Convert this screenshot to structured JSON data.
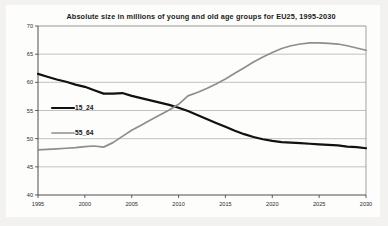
{
  "chart_data": {
    "type": "line",
    "title": "Absolute size in millions of young and old age groups for EU25, 1995-2030",
    "xlabel": "",
    "ylabel": "",
    "xlim": [
      1995,
      2030
    ],
    "ylim": [
      40,
      70
    ],
    "ytick_step": 5,
    "xtick_step": 5,
    "grid": true,
    "legend_position": "inside-left",
    "yticks": [
      "70",
      "65",
      "60",
      "55",
      "50",
      "45",
      "40"
    ],
    "xticks": [
      "1995",
      "2000",
      "2005",
      "2010",
      "2015",
      "2020",
      "2025",
      "2030"
    ],
    "x": [
      1995,
      1996,
      1997,
      1998,
      1999,
      2000,
      2001,
      2002,
      2003,
      2004,
      2005,
      2006,
      2007,
      2008,
      2009,
      2010,
      2011,
      2012,
      2013,
      2014,
      2015,
      2016,
      2017,
      2018,
      2019,
      2020,
      2021,
      2022,
      2023,
      2024,
      2025,
      2026,
      2027,
      2028,
      2029,
      2030
    ],
    "series": [
      {
        "name": "15_24",
        "color": "#111111",
        "values": [
          61.5,
          61.0,
          60.5,
          60.1,
          59.6,
          59.2,
          58.6,
          58.0,
          58.0,
          58.1,
          57.6,
          57.2,
          56.8,
          56.4,
          56.0,
          55.5,
          54.9,
          54.2,
          53.5,
          52.8,
          52.1,
          51.4,
          50.8,
          50.3,
          49.9,
          49.6,
          49.4,
          49.3,
          49.2,
          49.1,
          49.0,
          48.9,
          48.8,
          48.6,
          48.5,
          48.3
        ]
      },
      {
        "name": "55_64",
        "color": "#8e8e8e",
        "values": [
          48.0,
          48.1,
          48.2,
          48.3,
          48.4,
          48.6,
          48.7,
          48.5,
          49.3,
          50.4,
          51.5,
          52.4,
          53.3,
          54.2,
          55.1,
          56.1,
          57.6,
          58.2,
          58.9,
          59.7,
          60.6,
          61.6,
          62.6,
          63.6,
          64.5,
          65.3,
          66.0,
          66.5,
          66.8,
          67.0,
          67.0,
          66.9,
          66.8,
          66.5,
          66.1,
          65.7
        ]
      }
    ],
    "legend": [
      {
        "label": "15_24",
        "style": "thick-black-line"
      },
      {
        "label": "55_64",
        "style": "thin-gray-line"
      }
    ]
  }
}
